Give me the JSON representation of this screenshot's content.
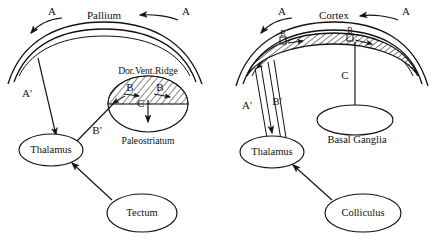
{
  "figure": {
    "title_left": "Pallium",
    "title_right": "Cortex",
    "panels": [
      {
        "id": "left-panel",
        "name": "reptilian-brain-schematic",
        "top_structure_label": "Pallium",
        "afferent_left_label": "A",
        "afferent_right_label": "A",
        "ridge_label": "Dor.Vent.Ridge",
        "striatum_label": "Paleostriatum",
        "ridge_arrow_left_label": "B",
        "ridge_arrow_right_label": "B",
        "descending_label": "C",
        "pallium_to_thalamus_label": "A'",
        "ridge_to_thalamus_label": "B'",
        "thalamus_label": "Thalamus",
        "tectum_label": "Tectum"
      },
      {
        "id": "right-panel",
        "name": "mammalian-brain-schematic",
        "top_structure_label": "Cortex",
        "afferent_left_label": "A",
        "afferent_right_label": "A",
        "cortex_marker_left_label": "B",
        "cortex_marker_right_label": "B",
        "descending_label": "C",
        "cortex_to_thalamus_label": "A'",
        "cortex_band_to_thalamus_label": "B'",
        "thalamus_label": "Thalamus",
        "basal_ganglia_label": "Basal Ganglia",
        "colliculus_label": "Colliculus"
      }
    ]
  },
  "colors": {
    "ink": "#111111",
    "paper": "#ffffff",
    "hatch": "#111111",
    "dash": "#555555"
  }
}
